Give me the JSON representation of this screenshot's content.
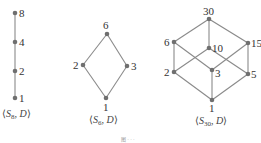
{
  "diagrams": [
    {
      "id": "s8",
      "caption_main": "S",
      "caption_sub": "8",
      "caption_rest": ", D",
      "nodes": [
        {
          "label": "8",
          "x": 15,
          "y": 13
        },
        {
          "label": "4",
          "x": 15,
          "y": 42
        },
        {
          "label": "2",
          "x": 15,
          "y": 71
        },
        {
          "label": "1",
          "x": 15,
          "y": 98
        }
      ],
      "edges": [
        [
          "8",
          "4"
        ],
        [
          "4",
          "2"
        ],
        [
          "2",
          "1"
        ]
      ]
    },
    {
      "id": "s6",
      "caption_main": "S",
      "caption_sub": "6",
      "caption_rest": ", D",
      "nodes": [
        {
          "label": "6",
          "x": 107,
          "y": 34
        },
        {
          "label": "2",
          "x": 83,
          "y": 65
        },
        {
          "label": "3",
          "x": 127,
          "y": 66
        },
        {
          "label": "1",
          "x": 106,
          "y": 98
        }
      ],
      "edges": [
        [
          "6",
          "2"
        ],
        [
          "6",
          "3"
        ],
        [
          "2",
          "1"
        ],
        [
          "3",
          "1"
        ]
      ]
    },
    {
      "id": "s30",
      "caption_main": "S",
      "caption_sub": "30",
      "caption_rest": ", D",
      "nodes": [
        {
          "label": "30",
          "x": 209,
          "y": 19
        },
        {
          "label": "6",
          "x": 174,
          "y": 42
        },
        {
          "label": "10",
          "x": 209,
          "y": 48
        },
        {
          "label": "15",
          "x": 248,
          "y": 43
        },
        {
          "label": "2",
          "x": 174,
          "y": 72
        },
        {
          "label": "3",
          "x": 212,
          "y": 70
        },
        {
          "label": "5",
          "x": 248,
          "y": 74
        },
        {
          "label": "1",
          "x": 212,
          "y": 100
        }
      ],
      "edges": [
        [
          "30",
          "6"
        ],
        [
          "30",
          "10"
        ],
        [
          "30",
          "15"
        ],
        [
          "6",
          "2"
        ],
        [
          "6",
          "3"
        ],
        [
          "10",
          "2"
        ],
        [
          "10",
          "5"
        ],
        [
          "15",
          "3"
        ],
        [
          "15",
          "5"
        ],
        [
          "2",
          "1"
        ],
        [
          "3",
          "1"
        ],
        [
          "5",
          "1"
        ]
      ]
    }
  ],
  "figure_caption": "图 · · ·"
}
